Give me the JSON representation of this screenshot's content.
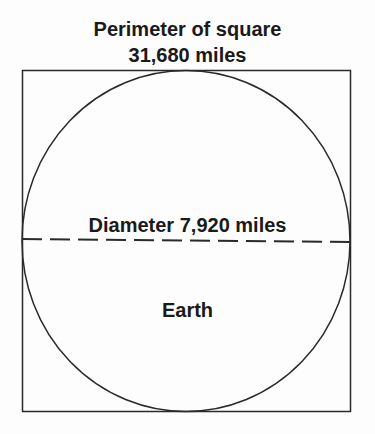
{
  "diagram": {
    "title_line1": "Perimeter of square",
    "title_line2": "31,680 miles",
    "diameter_label": "Diameter 7,920 miles",
    "circle_label": "Earth",
    "stroke_color": "#2a2a2a"
  }
}
